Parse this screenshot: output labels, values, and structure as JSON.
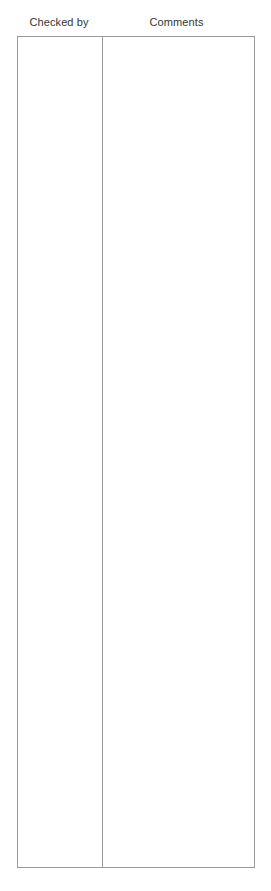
{
  "document": {
    "background_color": "#ffffff",
    "text_color": "#333333",
    "border_color": "#9a9a9a"
  },
  "table": {
    "headers": [
      {
        "label": "Checked by",
        "key": "checked_by"
      },
      {
        "label": "Comments",
        "key": "comments"
      }
    ],
    "rows": [
      {
        "checked_by": "",
        "comments": ""
      }
    ]
  }
}
